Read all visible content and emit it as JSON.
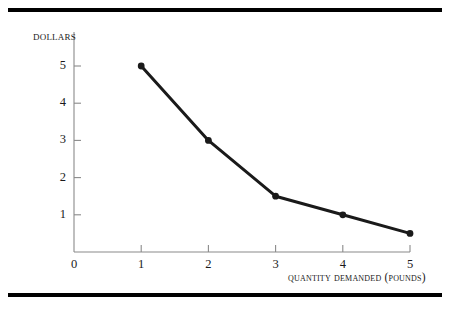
{
  "figure": {
    "background_color": "#ffffff",
    "rule_color": "#000000",
    "axis_color": "#8a8a8a",
    "series_color": "#1a1a1a"
  },
  "chart_data": {
    "type": "line",
    "title": "",
    "xlabel": "Quantity demanded (pounds)",
    "ylabel": "Dollars",
    "x": [
      1,
      2,
      3,
      4,
      5
    ],
    "values": [
      5,
      3,
      1.5,
      1,
      0.5
    ],
    "xlim": [
      0,
      5
    ],
    "ylim": [
      0,
      5.6
    ],
    "xticks": [
      0,
      1,
      2,
      3,
      4,
      5
    ],
    "xtick_labels": [
      "0",
      "1",
      "2",
      "3",
      "4",
      "5"
    ],
    "yticks": [
      1,
      2,
      3,
      4,
      5
    ],
    "ytick_labels": [
      "1",
      "2",
      "3",
      "4",
      "5"
    ],
    "grid": false,
    "legend": null,
    "marker": "circle",
    "line_width": 3,
    "series": [
      {
        "name": "Demand",
        "points": [
          {
            "x": 1,
            "y": 5
          },
          {
            "x": 2,
            "y": 3
          },
          {
            "x": 3,
            "y": 1.5
          },
          {
            "x": 4,
            "y": 1
          },
          {
            "x": 5,
            "y": 0.5
          }
        ]
      }
    ]
  }
}
